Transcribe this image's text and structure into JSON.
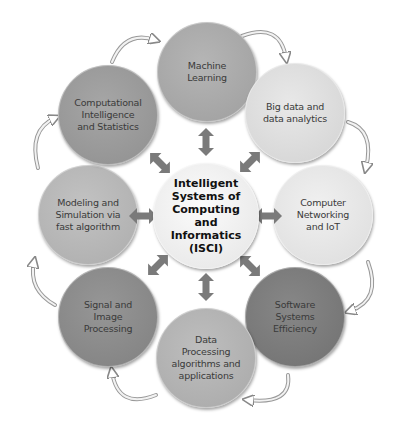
{
  "diagram": {
    "center": {
      "label": "Intelligent\nSystems of\nComputing\nand\nInformatics\n(ISCI)",
      "color": "#f0f0f0"
    },
    "nodes": [
      {
        "id": "machine-learning",
        "label": "Machine\nLearning",
        "color": "#a9a9a9"
      },
      {
        "id": "big-data",
        "label": "Big data and\ndata analytics",
        "color": "#dcdcdc"
      },
      {
        "id": "computer-networking",
        "label": "Computer\nNetworking\nand IoT",
        "color": "#e6e6e6"
      },
      {
        "id": "software-systems",
        "label": "Software\nSystems\nEfficiency",
        "color": "#7d7d7d"
      },
      {
        "id": "data-processing",
        "label": "Data\nProcessing\nalgorithms and\napplications",
        "color": "#b4b4b4"
      },
      {
        "id": "signal-image",
        "label": "Signal and\nImage\nProcessing",
        "color": "#8c8c8c"
      },
      {
        "id": "modeling-simulation",
        "label": "Modeling and\nSimulation via\nfast algorithm",
        "color": "#b8b8b8"
      },
      {
        "id": "computational-intelligence",
        "label": "Computational\nIntelligence\nand Statistics",
        "color": "#9a9a9a"
      }
    ],
    "connector_color": "#7a7a7a",
    "cycle_arrow_color": "#d8d8d8"
  }
}
